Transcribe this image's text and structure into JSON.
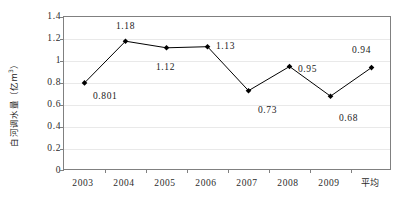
{
  "chart_data": {
    "type": "line",
    "title": "",
    "xlabel": "",
    "ylabel": "白河调水量（亿m³）",
    "ylabel_text": "白河调水量（亿m",
    "ylabel_sup": "3",
    "ylabel_tail": "）",
    "categories": [
      "2003",
      "2004",
      "2005",
      "2006",
      "2007",
      "2008",
      "2009",
      "平均"
    ],
    "values": [
      0.801,
      1.18,
      1.12,
      1.13,
      0.73,
      0.95,
      0.68,
      0.94
    ],
    "point_labels": [
      "0.801",
      "1.18",
      "1.12",
      "1.13",
      "0.73",
      "0.95",
      "0.68",
      "0.94"
    ],
    "ylim": [
      0,
      1.4
    ],
    "ytick_values": [
      0,
      0.2,
      0.4,
      0.6,
      0.8,
      1,
      1.2,
      1.4
    ],
    "ytick_labels": [
      "0",
      "0.2",
      "0.4",
      "0.6",
      "0.8",
      "1",
      "1.2",
      "1.4"
    ],
    "grid": true,
    "grid_axis": "y",
    "legend": false,
    "marker": "diamond",
    "marker_color": "#000000",
    "line_color": "#000000",
    "grid_color": "#e9e9e9",
    "axis_color": "#808080",
    "background": "#ffffff"
  },
  "labels": {
    "y_axis_title": "白河调水量（亿m³）",
    "y_ticks": [
      "1.4",
      "1.2",
      "1",
      "0.8",
      "0.6",
      "0.4",
      "0.2",
      "0"
    ],
    "x_ticks": [
      "2003",
      "2004",
      "2005",
      "2006",
      "2007",
      "2008",
      "2009",
      "平均"
    ],
    "data_labels": [
      "0.801",
      "1.18",
      "1.12",
      "1.13",
      "0.73",
      "0.95",
      "0.68",
      "0.94"
    ]
  }
}
